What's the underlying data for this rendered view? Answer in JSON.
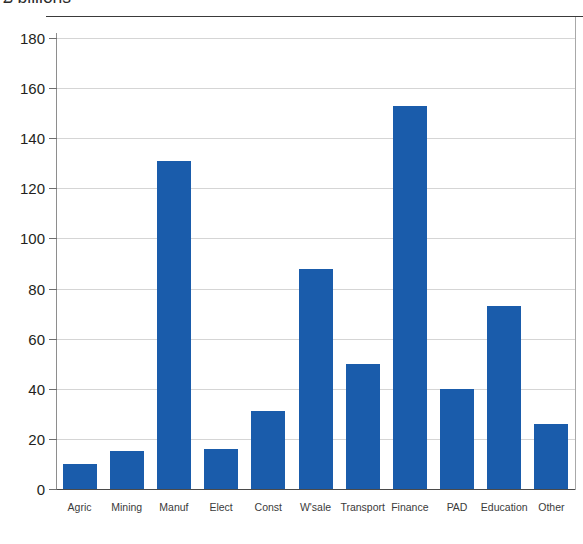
{
  "chart_data": {
    "type": "bar",
    "title": "£ billions",
    "subtitle": "",
    "xlabel": "",
    "ylabel": "",
    "categories": [
      "Agric",
      "Mining",
      "Manuf",
      "Elect",
      "Const",
      "W'sale",
      "Transport",
      "Finance",
      "PAD",
      "Education",
      "Other"
    ],
    "values": [
      10,
      15,
      131,
      16,
      31,
      88,
      50,
      153,
      40,
      73,
      26
    ],
    "ylim": [
      0,
      180
    ],
    "ytick_labels": [
      "180",
      "160",
      "140",
      "120",
      "100",
      "80",
      "60",
      "40",
      "20",
      "0"
    ],
    "ytick_values": [
      180,
      160,
      140,
      120,
      100,
      80,
      60,
      40,
      20,
      0
    ],
    "grid": "horizontal",
    "legend": "none",
    "bar_color": "#1a5cab",
    "gridline_color": "#d5d5d5",
    "axis_color": "#4a4a4a",
    "background_color": "#ffffff"
  }
}
